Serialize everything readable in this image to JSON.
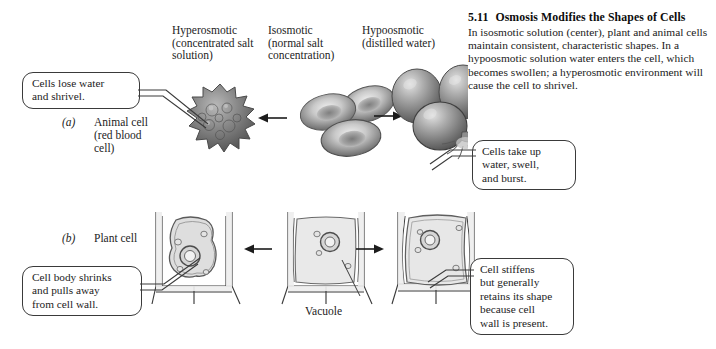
{
  "figure": {
    "number": "5.11",
    "title": "Osmosis Modifies the Shapes of Cells",
    "caption": "In isosmotic solution (center), plant and animal cells maintain consistent, characteristic shapes. In a hypoosmotic solution water enters the cell, which becomes swollen; a hyperosmotic environment will cause the cell to shrivel."
  },
  "columns": [
    {
      "key": "hyperosmotic",
      "label": "Hyperosmotic\n(concentrated salt\nsolution)"
    },
    {
      "key": "isosmotic",
      "label": "Isosmotic\n(normal salt\nconcentration)"
    },
    {
      "key": "hypoosmotic",
      "label": "Hypoosmotic\n(distilled water)"
    }
  ],
  "rows": [
    {
      "key": "animal",
      "letter": "(a)",
      "label": "Animal cell\n(red blood\ncell)"
    },
    {
      "key": "plant",
      "letter": "(b)",
      "label": "Plant cell"
    }
  ],
  "callouts": {
    "animal_left": "Cells lose water\nand shrivel.",
    "animal_right": "Cells take up\nwater, swell,\nand burst.",
    "plant_left": "Cell body shrinks\nand pulls away\nfrom cell wall.",
    "plant_right": "Cell stiffens\nbut generally\nretains its shape\nbecause cell\nwall is present."
  },
  "annotations": {
    "vacuole": "Vacuole"
  },
  "colors": {
    "background": "#ffffff",
    "ink": "#1a1a1a",
    "outline": "#3a3a3a",
    "cell_gray_dark": "#5d5d5d",
    "cell_gray_mid": "#9a9a9a",
    "cell_gray_light": "#d8d8d8",
    "plant_fill": "#e9e9e9"
  }
}
